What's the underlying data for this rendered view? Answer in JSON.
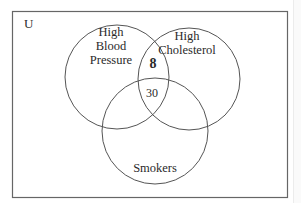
{
  "diagram": {
    "type": "venn",
    "universe_label": "U",
    "sets": [
      {
        "id": "bp",
        "label_lines": [
          "High",
          "Blood",
          "Pressure"
        ]
      },
      {
        "id": "chol",
        "label_lines": [
          "High",
          "Cholesterol"
        ]
      },
      {
        "id": "smk",
        "label_lines": [
          "Smokers"
        ]
      }
    ],
    "regions": [
      {
        "sets": [
          "bp",
          "chol"
        ],
        "only": true,
        "value": "8",
        "bold": true
      },
      {
        "sets": [
          "bp",
          "chol",
          "smk"
        ],
        "value": "30",
        "bold": false
      }
    ],
    "colors": {
      "stroke": "#555555",
      "text": "#2a2a2a",
      "background": "#ffffff"
    }
  }
}
